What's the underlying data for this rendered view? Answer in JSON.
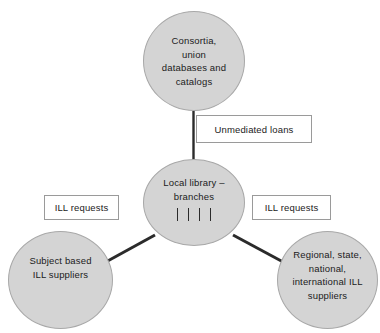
{
  "diagram": {
    "type": "hub-and-spoke",
    "background_color": "#ffffff",
    "node_fill_color": "#d4d4d4",
    "node_border_color": "#a8a8a8",
    "edge_color": "#2b2b2b",
    "label_box_border_color": "#9a9a9a",
    "nodes": [
      {
        "id": "consortia",
        "label": "Consortia,\nunion\ndatabases and\ncatalogs",
        "shape": "circle"
      },
      {
        "id": "local-library",
        "label": "Local library –\nbranches",
        "shape": "circle",
        "branch_tick_count": 4
      },
      {
        "id": "subject-suppliers",
        "label": "Subject based\nILL suppliers",
        "shape": "circle"
      },
      {
        "id": "regional-suppliers",
        "label": "Regional, state,\nnational,\ninternational ILL\nsuppliers",
        "shape": "circle"
      }
    ],
    "edge_labels": [
      {
        "id": "unmediated-loans",
        "text": "Unmediated loans",
        "connects": "local-library → consortia"
      },
      {
        "id": "ill-requests-left",
        "text": "ILL requests",
        "connects": "local-library → subject-suppliers"
      },
      {
        "id": "ill-requests-right",
        "text": "ILL requests",
        "connects": "local-library → regional-suppliers"
      }
    ]
  }
}
